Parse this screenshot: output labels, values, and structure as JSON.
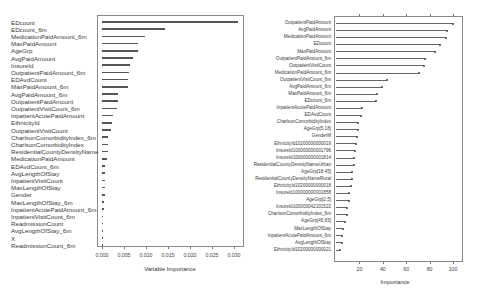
{
  "chart_data": [
    {
      "type": "bar",
      "orientation": "horizontal",
      "title": "",
      "xlabel": "Variable Importance",
      "ylabel": "",
      "xlim": [
        0,
        0.031
      ],
      "xticks": [
        "0.000",
        "0.005",
        "0.010",
        "0.015",
        "0.020",
        "0.025",
        "0.030"
      ],
      "grid": false,
      "categories": [
        "EDcount",
        "EDcount_6m",
        "MedicationPaidAmount_6m",
        "MaxPaidAmount",
        "AgeGrp",
        "AvgPaidAmount",
        "InsureId",
        "OutpatientPaidAmount_6m",
        "EDAvdCount",
        "MaxPaidAmount_6m",
        "AvgPaidAmount_6m",
        "OutpatientPaidAmount",
        "OutpatientVisitCount_6m",
        "InpatientAcutePaidAmount",
        "EthnicityId",
        "OutpatientVisitCount",
        "CharlsonComorbidityIndex_6m",
        "CharlsonComorbidityIndex",
        "ResidentialCountyDensityName",
        "MedicationPaidAmount",
        "EDAvdCount_6m",
        "AvgLengthOfStay",
        "InpatientVisitCount",
        "MaxLengthOfStay",
        "Gender",
        "MaxLengthOfStay_6m",
        "InpatientAcutePaidAmount_6m",
        "InpatientVisitCount_6m",
        "ReadmissionCount",
        "AvgLengthOfStay_6m",
        "X",
        "ReadmissionCount_6m"
      ],
      "values": [
        0.0309,
        0.0143,
        0.0098,
        0.0082,
        0.0082,
        0.0071,
        0.0064,
        0.0062,
        0.006,
        0.0058,
        0.0037,
        0.0037,
        0.0033,
        0.0026,
        0.0023,
        0.002,
        0.0014,
        0.0014,
        0.0013,
        0.0011,
        0.0007,
        0.0007,
        0.0006,
        0.0006,
        0.0006,
        0.0004,
        0.0004,
        0.0003,
        0.0003,
        0.0002,
        0.0002,
        0.0001
      ]
    },
    {
      "type": "bar",
      "orientation": "horizontal",
      "style": "lollipop",
      "title": "",
      "xlabel": "Importance",
      "ylabel": "",
      "xlim": [
        0,
        107
      ],
      "xticks": [
        "20",
        "40",
        "60",
        "80",
        "100"
      ],
      "grid": false,
      "categories": [
        "OutpatientPaidAmount",
        "AvgPaidAmount",
        "MedicationPaidAmount",
        "EDcount",
        "MaxPaidAmount",
        "OutpatientPaidAmount_6m",
        "OutpatientVisitCount",
        "MedicationPaidAmount_6m",
        "OutpatientVisitCount_6m",
        "AvgPaidAmount_6m",
        "MaxPaidAmount_6m",
        "EDcount_6m",
        "InpatientAcutePaidAmount",
        "EDAvdCount",
        "CharlsonComorbidityIndex",
        "AgeGrp[5,18]",
        "GenderM",
        "EthnicityId10200000000019",
        "InsureId100000000001796",
        "InsureId100000000001814",
        "ResidentialCountyDensityNameUrban",
        "AgeGrp[18,45]",
        "ResidentialCountyDensityNameRural",
        "EthnicityId10200000000018",
        "InsureId100000000001858",
        "AgeGrp[2,5]",
        "InsureId100000042101522",
        "CharlsonComorbidityIndex_6m",
        "AgeGrp[45,65]",
        "MaxLengthOfStay",
        "InpatientAcutePaidAmount_6m",
        "AvgLengthOfStay",
        "EthnicityId10200000000021"
      ],
      "values": [
        100,
        95,
        94,
        89,
        85,
        76,
        75,
        71,
        44,
        39,
        35,
        34,
        22,
        21,
        19,
        19,
        18,
        17,
        16.5,
        15.4,
        15.1,
        13.7,
        13.4,
        12.8,
        11.4,
        11.1,
        9.7,
        9.4,
        8.0,
        5.7,
        5.1,
        5.0,
        3.0
      ]
    }
  ]
}
